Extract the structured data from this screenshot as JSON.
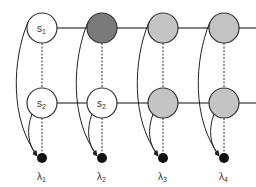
{
  "diagram": {
    "type": "graphical-model",
    "colors": {
      "stroke": "#333333",
      "white_node": "#ffffff",
      "dark_node": "#7a7a7a",
      "light_node": "#c4c4c4",
      "lambda_node": "#111111"
    },
    "columns": [
      {
        "index": 1,
        "top": {
          "label": "s",
          "sub": "1",
          "fill": "white"
        },
        "bottom": {
          "label": "s",
          "sub": "2",
          "fill": "white"
        },
        "lambda": {
          "label": "λ",
          "sub": "1"
        }
      },
      {
        "index": 2,
        "top": {
          "label": "",
          "sub": "",
          "fill": "dark"
        },
        "bottom": {
          "label": "s",
          "sub": "2",
          "fill": "white"
        },
        "lambda": {
          "label": "λ",
          "sub": "2"
        }
      },
      {
        "index": 3,
        "top": {
          "label": "",
          "sub": "",
          "fill": "light"
        },
        "bottom": {
          "label": "",
          "sub": "",
          "fill": "light"
        },
        "lambda": {
          "label": "λ",
          "sub": "3"
        }
      },
      {
        "index": 4,
        "top": {
          "label": "",
          "sub": "",
          "fill": "light"
        },
        "bottom": {
          "label": "",
          "sub": "",
          "fill": "light"
        },
        "lambda": {
          "label": "λ",
          "sub": "4"
        }
      }
    ],
    "edges": [
      {
        "type": "solid",
        "desc": "horizontal chain between top nodes"
      },
      {
        "type": "solid",
        "desc": "horizontal chain between bottom nodes"
      },
      {
        "type": "dotted",
        "desc": "vertical top node to bottom node to lambda"
      },
      {
        "type": "curved-arrow",
        "desc": "top node to lambda"
      },
      {
        "type": "curved-arrow",
        "desc": "bottom node to lambda"
      }
    ]
  }
}
